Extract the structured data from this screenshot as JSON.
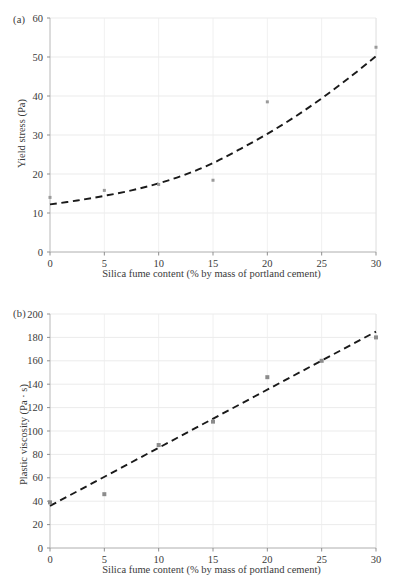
{
  "figure": {
    "panel_a_tag": "(a)",
    "panel_b_tag": "(b)"
  },
  "chart_data": [
    {
      "type": "scatter",
      "panel": "(a)",
      "title": "",
      "xlabel": "Silica fume content (% by mass of portland cement)",
      "ylabel": "Yield stress (Pa)",
      "xlim": [
        0,
        30
      ],
      "ylim": [
        0,
        60
      ],
      "xticks": [
        0,
        5,
        10,
        15,
        20,
        25,
        30
      ],
      "yticks": [
        0,
        10,
        20,
        30,
        40,
        50,
        60
      ],
      "xtick_labels": [
        "0",
        "5",
        "10",
        "15",
        "20",
        "25",
        "30"
      ],
      "ytick_labels": [
        "0",
        "10",
        "20",
        "30",
        "40",
        "50",
        "60"
      ],
      "grid": true,
      "legend": "none",
      "marker_color": "#9a9a9a",
      "trend_color": "#1a1a1a",
      "trend_style": "dashed",
      "series": [
        {
          "name": "Yield stress",
          "x": [
            0,
            5,
            10,
            15,
            20,
            30
          ],
          "values": [
            14.0,
            15.8,
            17.3,
            18.4,
            38.5,
            52.5
          ]
        }
      ],
      "trend": {
        "name": "exponential fit",
        "x": [
          0,
          2.5,
          5,
          7.5,
          10,
          12.5,
          15,
          17.5,
          20,
          22.5,
          25,
          27.5,
          30
        ],
        "values": [
          12.2,
          13.2,
          14.4,
          15.8,
          17.6,
          19.9,
          22.8,
          26.4,
          30.3,
          34.6,
          39.4,
          44.6,
          50.2
        ]
      }
    },
    {
      "type": "scatter",
      "panel": "(b)",
      "title": "",
      "xlabel": "Silica fume content (% by mass of portland cement)",
      "ylabel": "Plastic viscosity (Pa · s)",
      "xlim": [
        0,
        30
      ],
      "ylim": [
        0,
        200
      ],
      "xticks": [
        0,
        5,
        10,
        15,
        20,
        25,
        30
      ],
      "yticks": [
        0,
        20,
        40,
        60,
        80,
        100,
        120,
        140,
        160,
        180,
        200
      ],
      "xtick_labels": [
        "0",
        "5",
        "10",
        "15",
        "20",
        "25",
        "30"
      ],
      "ytick_labels": [
        "0",
        "20",
        "40",
        "60",
        "80",
        "100",
        "120",
        "140",
        "160",
        "180",
        "200"
      ],
      "grid": true,
      "legend": "none",
      "marker_color": "#8c8c8c",
      "trend_color": "#1a1a1a",
      "trend_style": "dashed",
      "series": [
        {
          "name": "Plastic viscosity",
          "x": [
            0,
            5,
            10,
            15,
            20,
            25,
            30
          ],
          "values": [
            39,
            46,
            88,
            108,
            146,
            160,
            180
          ]
        }
      ],
      "trend": {
        "name": "linear fit",
        "x": [
          0,
          30
        ],
        "values": [
          36,
          185
        ]
      }
    }
  ]
}
